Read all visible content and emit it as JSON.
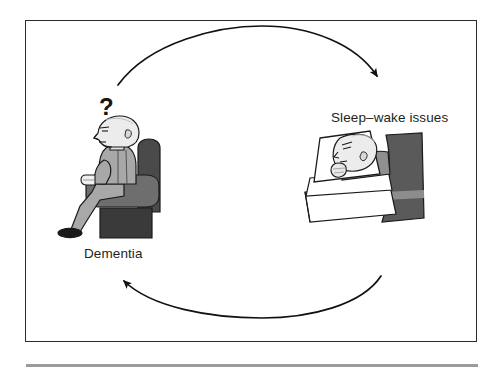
{
  "figure": {
    "type": "cycle-diagram",
    "background_color": "#ffffff",
    "frame_color": "#2b2b2b",
    "rule_color": "#9b9b9b",
    "nodes": [
      {
        "id": "dementia",
        "label": "Dementia",
        "illustration": "elderly-person-seated-in-armchair",
        "annotation": "?"
      },
      {
        "id": "sleep-wake",
        "label": "Sleep–wake issues",
        "illustration": "person-lying-awake-in-bed"
      }
    ],
    "arrows": [
      {
        "id": "dementia-to-sleep",
        "from": "dementia",
        "to": "sleep-wake",
        "direction": "clockwise-top",
        "style": "curved-arrow"
      },
      {
        "id": "sleep-to-dementia",
        "from": "sleep-wake",
        "to": "dementia",
        "direction": "clockwise-bottom",
        "style": "curved-arrow"
      }
    ],
    "annotation_symbol": "?",
    "palette": {
      "ink": "#231f20",
      "outline": "#1a1a1a",
      "skin": "#e8e8e8",
      "body_light": "#a8a8a8",
      "chair_arm": "#6e6e6e",
      "chair_back": "#4a4a4a",
      "chair_base": "#3a3a3a",
      "headboard": "#5a5a5a",
      "headboard_stripe": "#8d8d8d",
      "bed_sheet": "#ffffff",
      "blanket": "#8f8f8f"
    }
  },
  "labels": {
    "sleep_wake": "Sleep–wake issues",
    "dementia": "Dementia",
    "question": "?"
  }
}
